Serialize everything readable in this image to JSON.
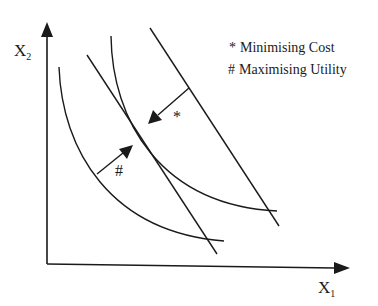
{
  "diagram": {
    "type": "economics-indifference-budget",
    "axes": {
      "x_label": "X",
      "x_subscript": "1",
      "y_label": "X",
      "y_subscript": "2"
    },
    "legend": {
      "items": [
        {
          "symbol": "*",
          "text": "Minimising Cost"
        },
        {
          "symbol": "#",
          "text": "Maximising Utility"
        }
      ]
    },
    "markers": {
      "cost_marker": "*",
      "utility_marker": "#"
    },
    "colors": {
      "stroke": "#1a1a1a",
      "background": "#ffffff"
    }
  }
}
